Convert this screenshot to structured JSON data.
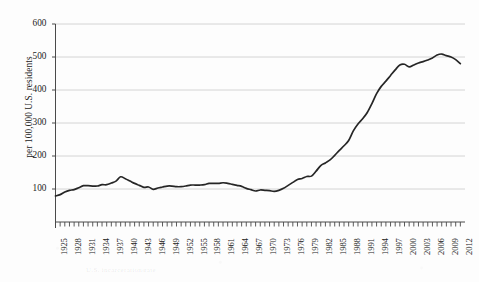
{
  "figure": {
    "background_color": "#fdfdfd",
    "line_color": "#262626",
    "grid_color": "#c9c9c9",
    "axis_color": "#4a4a4a",
    "ghost_caption": "U.S. incarceration rate"
  },
  "chart_data": {
    "type": "line",
    "title": "",
    "subtitle": "",
    "xlabel": "",
    "ylabel": "per 100,000 U.S. residents",
    "xlim": [
      1925,
      2013
    ],
    "ylim": [
      0,
      600
    ],
    "grid": true,
    "grid_axis": "y",
    "legend": false,
    "legend_position": "none",
    "y_ticks": [
      100,
      200,
      300,
      400,
      500,
      600
    ],
    "y_tick_labels": [
      "100",
      "200",
      "300",
      "400",
      "500",
      "600"
    ],
    "x_tick_labels": [
      "1925",
      "1928",
      "1931",
      "1934",
      "1937",
      "1940",
      "1943",
      "1946",
      "1949",
      "1952",
      "1955",
      "1958",
      "1961",
      "1964",
      "1967",
      "1970",
      "1973",
      "1976",
      "1979",
      "1982",
      "1985",
      "1988",
      "1991",
      "1994",
      "1997",
      "2000",
      "2003",
      "2006",
      "2009",
      "2012"
    ],
    "x_tick_step": 3,
    "x_minor_ticks_every": 1,
    "series": [
      {
        "name": "Incarceration rate",
        "color": "#262626",
        "x": [
          1925,
          1926,
          1927,
          1928,
          1929,
          1930,
          1931,
          1932,
          1933,
          1934,
          1935,
          1936,
          1937,
          1938,
          1939,
          1940,
          1941,
          1942,
          1943,
          1944,
          1945,
          1946,
          1947,
          1948,
          1949,
          1950,
          1951,
          1952,
          1953,
          1954,
          1955,
          1956,
          1957,
          1958,
          1959,
          1960,
          1961,
          1962,
          1963,
          1964,
          1965,
          1966,
          1967,
          1968,
          1969,
          1970,
          1971,
          1972,
          1973,
          1974,
          1975,
          1976,
          1977,
          1978,
          1979,
          1980,
          1981,
          1982,
          1983,
          1984,
          1985,
          1986,
          1987,
          1988,
          1989,
          1990,
          1991,
          1992,
          1993,
          1994,
          1995,
          1996,
          1997,
          1998,
          1999,
          2000,
          2001,
          2002,
          2003,
          2004,
          2005,
          2006,
          2007,
          2008,
          2009,
          2010,
          2011,
          2012
        ],
        "values": [
          79,
          83,
          91,
          96,
          98,
          104,
          110,
          110,
          109,
          109,
          113,
          113,
          118,
          124,
          137,
          131,
          124,
          117,
          111,
          105,
          106,
          99,
          103,
          106,
          109,
          109,
          107,
          107,
          109,
          112,
          112,
          112,
          113,
          117,
          117,
          117,
          119,
          117,
          114,
          111,
          108,
          102,
          98,
          94,
          97,
          96,
          95,
          93,
          96,
          102,
          111,
          120,
          129,
          132,
          138,
          139,
          154,
          171,
          179,
          188,
          202,
          217,
          231,
          247,
          276,
          297,
          313,
          332,
          359,
          389,
          411,
          427,
          444,
          461,
          476,
          478,
          470,
          476,
          482,
          486,
          491,
          497,
          506,
          509,
          504,
          500,
          492,
          480
        ]
      }
    ]
  }
}
